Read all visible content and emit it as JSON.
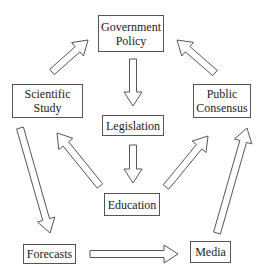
{
  "diagram": {
    "nodes": [
      {
        "id": "government-policy",
        "label_lines": [
          "Government",
          "Policy"
        ],
        "box": [
          98,
          15,
          66,
          37
        ]
      },
      {
        "id": "scientific-study",
        "label_lines": [
          "Scientific",
          "Study"
        ],
        "box": [
          12,
          84,
          71,
          34
        ]
      },
      {
        "id": "public-consensus",
        "label_lines": [
          "Public",
          "Consensus"
        ],
        "box": [
          193,
          84,
          58,
          34
        ]
      },
      {
        "id": "legislation",
        "label_lines": [
          "Legislation"
        ],
        "box": [
          102,
          115,
          62,
          21
        ]
      },
      {
        "id": "education",
        "label_lines": [
          "Education"
        ],
        "box": [
          104,
          193,
          56,
          23
        ]
      },
      {
        "id": "forecasts",
        "label_lines": [
          "Forecasts"
        ],
        "box": [
          23,
          244,
          53,
          20
        ]
      },
      {
        "id": "media",
        "label_lines": [
          "Media"
        ],
        "box": [
          190,
          241,
          41,
          22
        ]
      }
    ],
    "edges": [
      {
        "from": "scientific-study",
        "to": "government-policy",
        "tail": [
          52,
          72
        ],
        "head": [
          88,
          40
        ]
      },
      {
        "from": "public-consensus",
        "to": "government-policy",
        "tail": [
          215,
          73
        ],
        "head": [
          177,
          40
        ]
      },
      {
        "from": "government-policy",
        "to": "legislation",
        "tail": [
          133,
          59
        ],
        "head": [
          133,
          106
        ]
      },
      {
        "from": "legislation",
        "to": "education",
        "tail": [
          133,
          145
        ],
        "head": [
          133,
          183
        ]
      },
      {
        "from": "education",
        "to": "scientific-study",
        "tail": [
          100,
          186
        ],
        "head": [
          57,
          133
        ]
      },
      {
        "from": "education",
        "to": "public-consensus",
        "tail": [
          166,
          187
        ],
        "head": [
          208,
          136
        ]
      },
      {
        "from": "scientific-study",
        "to": "forecasts",
        "tail": [
          20,
          128
        ],
        "head": [
          50,
          233
        ]
      },
      {
        "from": "media",
        "to": "public-consensus",
        "tail": [
          217,
          233
        ],
        "head": [
          247,
          128
        ]
      },
      {
        "from": "forecasts",
        "to": "media",
        "tail": [
          90,
          254
        ],
        "head": [
          178,
          254
        ]
      }
    ],
    "style": {
      "stroke": "#555555",
      "fill": "#ffffff",
      "text": "#222222"
    }
  }
}
